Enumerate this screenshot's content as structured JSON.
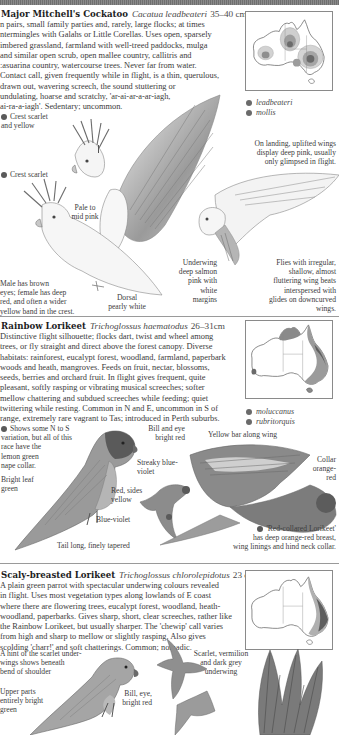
{
  "page": {
    "style": "grayscale field guide page",
    "colors": {
      "background": "#ffffff",
      "text": "#2a2a2a",
      "rule": "#9a9a9a",
      "header_bar": "#7a7a7a",
      "range_dot": "#6a6a6a"
    }
  },
  "species": [
    {
      "common_name": "Major Mitchell's Cockatoo",
      "latin_name": "Cacatua leadbeateri",
      "size": "35–40 cm",
      "description_lines": [
        "n pairs, small family parties and, rarely, large flocks; at times",
        "ntermingles with Galahs or Little Corellas. Uses open, sparsely",
        "imbered grassland, farmland with well-treed paddocks, mulga",
        "and similar open scrub, open mallee country, callitris and",
        ":asuarina country, watercourse trees. Never far from water.",
        "Contact call, given frequently while in flight, is a thin, querulous,",
        "drawn out, wavering screech, the sound stuttering or",
        "undulating, hoarse and scratchy, 'ar-ai-ar-a-ar-iagh,",
        "ai-ra-a-iagh'. Sedentary; uncommon."
      ],
      "map_legend": [
        "leadbeateri",
        "mollis"
      ],
      "annotations": {
        "crest_top": [
          "Crest scarlet",
          "and yellow"
        ],
        "crest_lower": [
          "Crest scarlet"
        ],
        "pale_pink": [
          "Pale to",
          "mid pink"
        ],
        "male_female": [
          "Male has brown",
          "eyes; female has deep",
          "red, and often a wider",
          "yellow band in the crest."
        ],
        "dorsal": [
          "Dorsal",
          "pearly white"
        ],
        "underwing": [
          "Underwing",
          "deep salmon",
          "pink with",
          "white",
          "margins"
        ],
        "landing": [
          "On landing, uplifted wings",
          "display deep pink, usually",
          "only glimpsed in flight."
        ],
        "flight": [
          "Flies with irregular,",
          "shallow, almost",
          "fluttering wing beats",
          "interspersed with",
          "glides on downcurved",
          "wings."
        ]
      }
    },
    {
      "common_name": "Rainbow Lorikeet",
      "latin_name": "Trichoglossus haematodus",
      "size": "26–31cm",
      "description_lines": [
        "Distinctive flight silhouette; flocks dart, twist and wheel among",
        "trees, or fly straight and direct above the forest canopy. Diverse",
        "habitats: rainforest, eucalypt forest, woodland, farmland, paperbark",
        "woods and heath, mangroves. Feeds on fruit, nectar, blossoms,",
        "seeds, berries and orchard fruit. In flight gives frequent, quite",
        "pleasant, softly rasping or vibrating musical screeches; softer",
        "mellow chattering and subdued screeches while feeding; quiet",
        "twittering while resting. Common in N and E, uncommon in S of",
        "range, extremely rare vagrant to Tas; introduced in Perth suburbs."
      ],
      "map_legend": [
        "moluccanus",
        "rubritorquis"
      ],
      "annotations": {
        "variation": [
          "Shows some N to S",
          "variation, but all of this",
          "race have the",
          "lemon green",
          "nape collar."
        ],
        "leaf_green": [
          "Bright leaf",
          "green"
        ],
        "bill_eye": [
          "Bill and eye",
          "bright red"
        ],
        "streaky": [
          "Streaky blue-",
          "violet"
        ],
        "red_sides": [
          "Red, sides",
          "yellow"
        ],
        "blue_violet": [
          "Blue-violet"
        ],
        "yellow_bar": [
          "Yellow bar along wing"
        ],
        "collar": [
          "Collar",
          "orange-",
          "red"
        ],
        "tail": [
          "Tail long, finely tapered"
        ],
        "red_collared": [
          "'Red-collared Lorikeet'",
          "has deep orange-red breast,",
          "wing linings and hind neck collar."
        ]
      }
    },
    {
      "common_name": "Scaly-breasted Lorikeet",
      "latin_name": "Trichoglossus chlorolepidotus",
      "size": "23 cm",
      "description_lines": [
        "A plain green parrot with spectacular underwing colours revealed",
        "in flight. Uses most vegetation types along lowlands of E coast",
        "where there are flowering trees, eucalypt forest, woodland, heath-",
        "woodland, paperbarks. Gives sharp, short, clear screeches, rather like",
        "the Rainbow Lorikeet, but usually sharper. The 'chewip' call varies",
        "from high and sharp to mellow or slightly rasping. Also gives",
        "scolding 'charr!' and soft chatterings. Common; nomadic."
      ],
      "annotations": {
        "hint_scarlet": [
          "A hint of the scarlet under-",
          "wings shows beneath",
          "bend of shoulder"
        ],
        "upper_parts": [
          "Upper parts",
          "entirely bright",
          "green"
        ],
        "bill_eye": [
          "Bill, eye,",
          "bright red"
        ],
        "underwing": [
          "Scarlet, vermilion",
          "and dark grey",
          "underwing"
        ]
      }
    }
  ]
}
